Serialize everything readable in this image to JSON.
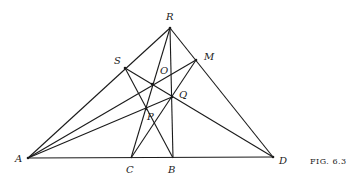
{
  "figure": {
    "caption": "FIG. 6.3",
    "points": {
      "A": {
        "label": "A",
        "x": 28,
        "y": 158
      },
      "C": {
        "label": "C",
        "x": 131,
        "y": 158
      },
      "B": {
        "label": "B",
        "x": 173,
        "y": 158
      },
      "D": {
        "label": "D",
        "x": 273,
        "y": 157
      },
      "R": {
        "label": "R",
        "x": 170,
        "y": 28
      },
      "S": {
        "label": "S",
        "x": 125,
        "y": 68
      },
      "M": {
        "label": "M",
        "x": 196,
        "y": 60
      },
      "O": {
        "label": "O",
        "x": 152,
        "y": 84
      },
      "Q": {
        "label": "Q",
        "x": 172,
        "y": 97
      },
      "P": {
        "label": "P",
        "x": 146,
        "y": 109
      }
    },
    "segments": [
      "A-R",
      "R-D",
      "A-D",
      "R-B",
      "R-C",
      "A-M",
      "A-Q",
      "S-D",
      "S-B",
      "C-M"
    ]
  }
}
